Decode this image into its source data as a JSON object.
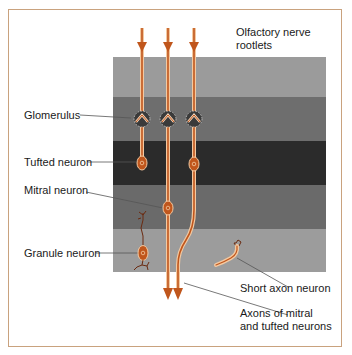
{
  "figure": {
    "colors": {
      "frame": "#c9a27e",
      "fiber": "#c0561c",
      "fiber_highlight": "#f4c9a0",
      "band_light": "#9b9b9b",
      "band_medium": "#6c6c6c",
      "band_dark": "#2b2b2b"
    },
    "bands": [
      {
        "name": "light-top",
        "top": 57,
        "height": 40,
        "color": "#9b9b9b"
      },
      {
        "name": "glomerular",
        "top": 97,
        "height": 44,
        "color": "#6e6e6e"
      },
      {
        "name": "dark-middle",
        "top": 141,
        "height": 44,
        "color": "#2b2b2b"
      },
      {
        "name": "mitral",
        "top": 185,
        "height": 44,
        "color": "#6a6a6a"
      },
      {
        "name": "granule",
        "top": 229,
        "height": 43,
        "color": "#9c9c9c"
      }
    ],
    "labels": {
      "olfactory": "Olfactory nerve",
      "olfactory2": "rootlets",
      "glomerulus": "Glomerulus",
      "tufted": "Tufted neuron",
      "mitral": "Mitral neuron",
      "granule": "Granule neuron",
      "short_axon": "Short axon neuron",
      "axons1": "Axons of mitral",
      "axons2": "and tufted neurons"
    }
  }
}
